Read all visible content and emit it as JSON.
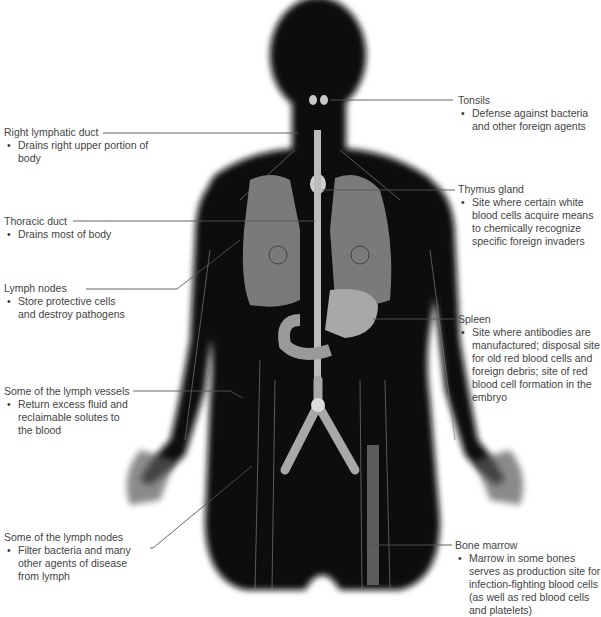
{
  "diagram": {
    "colors": {
      "body": "#0a0a0a",
      "organ_gray": "#7a7a7a",
      "organ_light": "#b8b8b8",
      "vessel": "#9a9a9a",
      "leader_line": "#555555",
      "text": "#444444"
    },
    "labels": [
      {
        "id": "right-lymphatic-duct",
        "title": "Right lymphatic duct",
        "desc": "Drains right upper portion of body"
      },
      {
        "id": "thoracic-duct",
        "title": "Thoracic duct",
        "desc": "Drains most of body"
      },
      {
        "id": "lymph-nodes",
        "title": "Lymph nodes",
        "desc": "Store protective cells and destroy pathogens"
      },
      {
        "id": "lymph-vessels",
        "title": "Some of the lymph vessels",
        "desc": "Return excess fluid and reclaimable solutes to the blood"
      },
      {
        "id": "some-lymph-nodes",
        "title": "Some of the lymph nodes",
        "desc": "Filter bacteria and many other agents of disease from lymph"
      },
      {
        "id": "tonsils",
        "title": "Tonsils",
        "desc": "Defense against bacteria and other foreign agents"
      },
      {
        "id": "thymus-gland",
        "title": "Thymus gland",
        "desc": "Site where certain white blood cells acquire means to chemically recognize specific foreign invaders"
      },
      {
        "id": "spleen",
        "title": "Spleen",
        "desc": "Site where antibodies are manufactured; disposal site for old red blood cells and foreign debris; site of red blood cell formation in the embryo"
      },
      {
        "id": "bone-marrow",
        "title": "Bone marrow",
        "desc": "Marrow in some bones serves as production site for infection-fighting blood cells (as well as red blood cells and platelets)"
      }
    ]
  }
}
